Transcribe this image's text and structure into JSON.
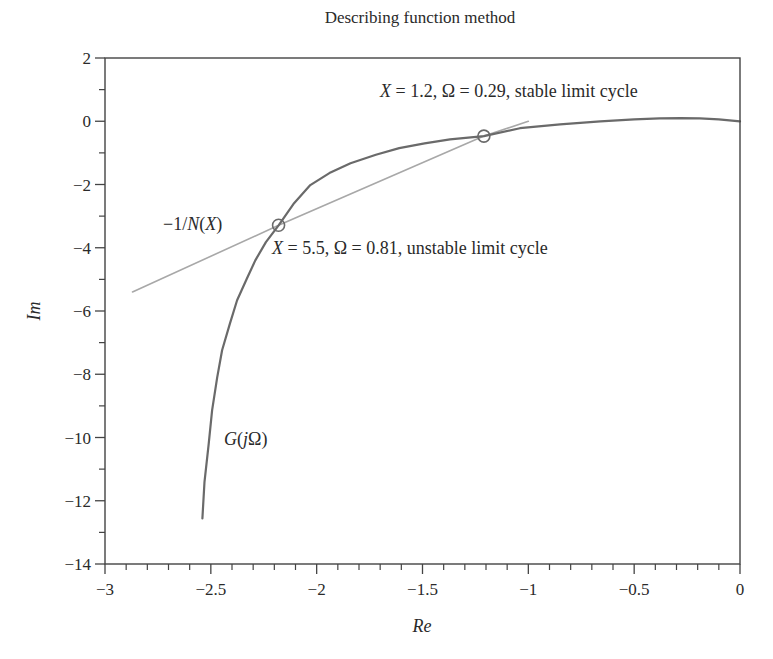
{
  "chart_data": {
    "type": "line",
    "title": "Describing function method",
    "xlabel": "Re",
    "ylabel": "Im",
    "xlim": [
      -3,
      0
    ],
    "ylim": [
      -14,
      2
    ],
    "grid": false,
    "x_ticks": [
      -3,
      -2.5,
      -2,
      -1.5,
      -1,
      -0.5,
      0
    ],
    "x_tick_labels": [
      "−3",
      "−2.5",
      "−2",
      "−1.5",
      "−1",
      "−0.5",
      "0"
    ],
    "y_ticks": [
      2,
      0,
      -2,
      -4,
      -6,
      -8,
      -10,
      -12,
      -14
    ],
    "y_tick_labels": [
      "2",
      "0",
      "−2",
      "−4",
      "−6",
      "−8",
      "−10",
      "−12",
      "−14"
    ],
    "series": [
      {
        "name": "G(jΩ)",
        "color": "#6a6a6a",
        "x": [
          -2.54,
          -2.53,
          -2.51,
          -2.494,
          -2.47,
          -2.447,
          -2.41,
          -2.376,
          -2.33,
          -2.29,
          -2.24,
          -2.18,
          -2.11,
          -2.03,
          -1.94,
          -1.84,
          -1.72,
          -1.61,
          -1.49,
          -1.37,
          -1.21,
          -1.04,
          -0.85,
          -0.66,
          -0.5,
          -0.38,
          -0.28,
          -0.19,
          -0.1,
          0
        ],
        "y": [
          -12.56,
          -11.4,
          -10.2,
          -9.14,
          -8.1,
          -7.24,
          -6.4,
          -5.66,
          -4.98,
          -4.4,
          -3.82,
          -3.29,
          -2.62,
          -2.02,
          -1.64,
          -1.33,
          -1.06,
          -0.85,
          -0.7,
          -0.57,
          -0.47,
          -0.22,
          -0.1,
          0.0,
          0.06,
          0.09,
          0.1,
          0.09,
          0.06,
          0.0
        ]
      },
      {
        "name": "−1/N(X)",
        "color": "#a8a8a8",
        "x": [
          -2.87,
          -2.18,
          -1.21,
          -1.0
        ],
        "y": [
          -5.4,
          -3.29,
          -0.47,
          0.0
        ]
      }
    ],
    "intersections": [
      {
        "x": -2.18,
        "y": -3.29,
        "label": "X = 5.5, Ω = 0.81, unstable limit cycle"
      },
      {
        "x": -1.21,
        "y": -0.47,
        "label": "X = 1.2, Ω = 0.29, stable limit cycle"
      }
    ],
    "annotations": [
      {
        "text": "X = 1.2, Ω = 0.29, stable limit cycle",
        "x": -1.83,
        "y": 0.85
      },
      {
        "text": "X = 5.5, Ω = 0.81, unstable limit cycle",
        "x": -2.17,
        "y": -4.1
      },
      {
        "text": "−1/N(X)",
        "x": -2.65,
        "y": -3.3
      },
      {
        "text": "G(jΩ)",
        "x": -2.43,
        "y": -9.9
      }
    ]
  },
  "labels": {
    "title": "Describing function method",
    "xlabel": "Re",
    "ylabel": "Im",
    "stable_annotation": {
      "italic_var": "X",
      "rest": " = 1.2, Ω = 0.29, stable limit cycle"
    },
    "unstable_annotation": {
      "italic_var": "X",
      "rest": " = 5.5, Ω = 0.81, unstable limit cycle"
    },
    "neg_inv_N": {
      "prefix": "−1/",
      "N": "N",
      "open": "(",
      "X": "X",
      "close": ")"
    },
    "G_label": {
      "G": "G",
      "open": "(",
      "j": "j",
      "Omega": "Ω",
      "close": ")"
    }
  }
}
